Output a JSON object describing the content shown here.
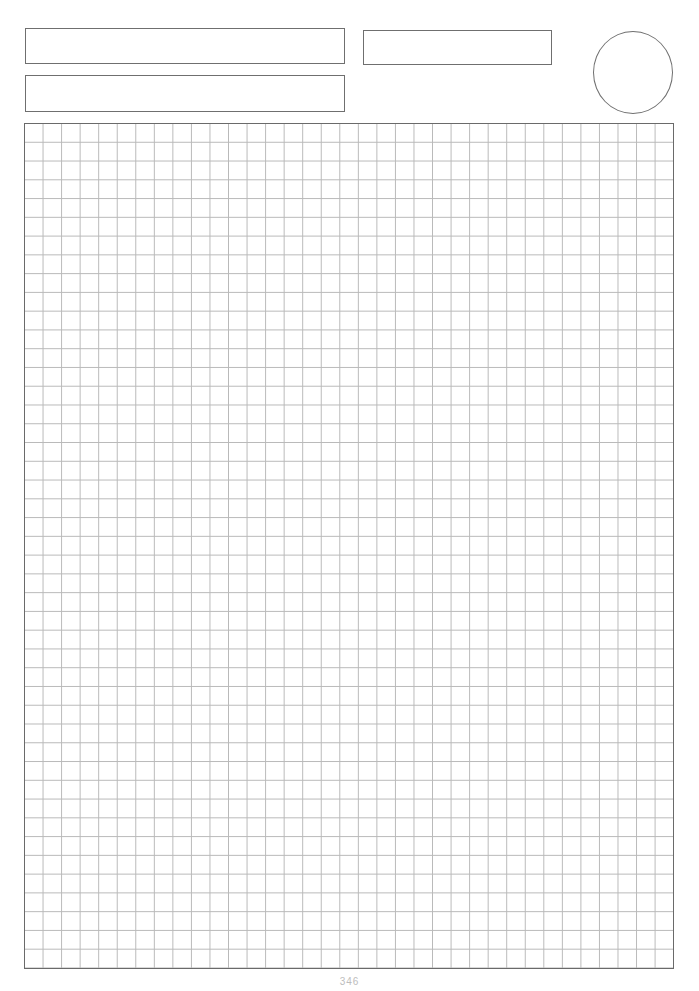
{
  "page": {
    "type": "graph-paper worksheet",
    "header": {
      "fields": [
        {
          "name": "name-field",
          "value": ""
        },
        {
          "name": "class-field",
          "value": ""
        },
        {
          "name": "date-field",
          "value": ""
        }
      ],
      "score_circle": {
        "value": ""
      }
    },
    "grid": {
      "columns": 35,
      "rows": 45,
      "line_color": "#b9b9b9",
      "border_color": "#6a6a6a"
    },
    "footer": {
      "page_number": "346"
    }
  }
}
